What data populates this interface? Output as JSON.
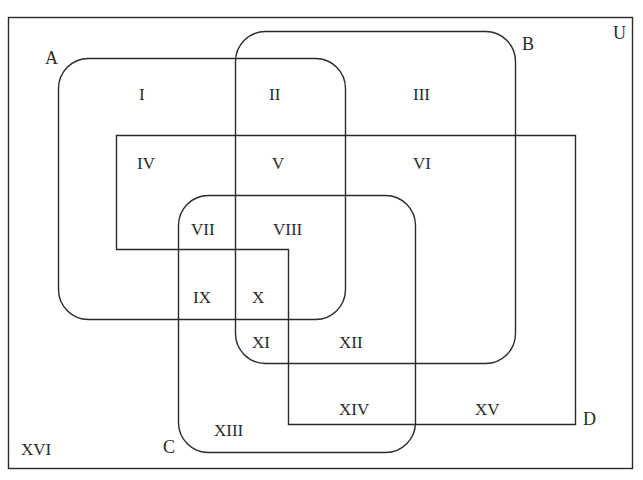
{
  "diagram": {
    "type": "venn",
    "universe_label": "U",
    "sets": [
      {
        "name": "A",
        "label": "A"
      },
      {
        "name": "B",
        "label": "B"
      },
      {
        "name": "C",
        "label": "C"
      },
      {
        "name": "D",
        "label": "D"
      }
    ],
    "regions": [
      {
        "id": "I",
        "label": "I"
      },
      {
        "id": "II",
        "label": "II"
      },
      {
        "id": "III",
        "label": "III"
      },
      {
        "id": "IV",
        "label": "IV"
      },
      {
        "id": "V",
        "label": "V"
      },
      {
        "id": "VI",
        "label": "VI"
      },
      {
        "id": "VII",
        "label": "VII"
      },
      {
        "id": "VIII",
        "label": "VIII"
      },
      {
        "id": "IX",
        "label": "IX"
      },
      {
        "id": "X",
        "label": "X"
      },
      {
        "id": "XI",
        "label": "XI"
      },
      {
        "id": "XII",
        "label": "XII"
      },
      {
        "id": "XIII",
        "label": "XIII"
      },
      {
        "id": "XIV",
        "label": "XIV"
      },
      {
        "id": "XV",
        "label": "XV"
      },
      {
        "id": "XVI",
        "label": "XVI"
      }
    ],
    "stroke_color": "#2a2a2a",
    "background": "#ffffff"
  }
}
